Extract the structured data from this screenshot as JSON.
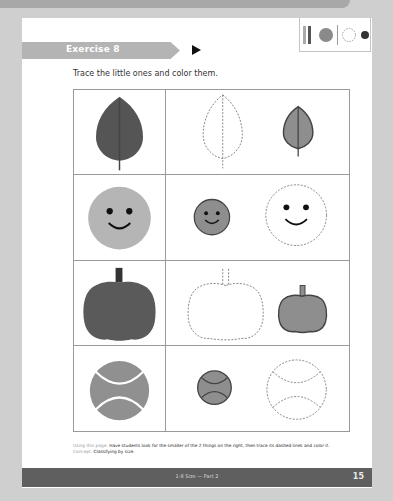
{
  "header": {
    "exercise_label": "Exercise 8",
    "instruction": "Trace the little ones and color them."
  },
  "toolbar_icons": [
    {
      "name": "pencil-crayon-icon"
    },
    {
      "name": "color-fill-circle-icon",
      "color": "#8a8a8a"
    },
    {
      "name": "dashed-trace-circle-icon"
    },
    {
      "name": "small-dark-circle-icon",
      "color": "#333333"
    }
  ],
  "rows": [
    {
      "item": "leaf",
      "large_color": "#555555",
      "small_color": "#8e8e8e"
    },
    {
      "item": "smiley-face",
      "large_color": "#b5b5b5",
      "small_color": "#8e8e8e"
    },
    {
      "item": "pumpkin",
      "large_color": "#5a5a5a",
      "small_color": "#8e8e8e"
    },
    {
      "item": "tennis-ball",
      "large_color": "#909090",
      "small_color": "#8e8e8e"
    }
  ],
  "note": {
    "using_label": "Using this page:",
    "using_text": "Have students look for the smaller of the 2 things on the right, then trace its dashed lines and color it.",
    "concept_label": "Concept:",
    "concept_text": "Classifying by size."
  },
  "footer": {
    "section": "1-8 Size — Part 2",
    "page_number": "15"
  }
}
